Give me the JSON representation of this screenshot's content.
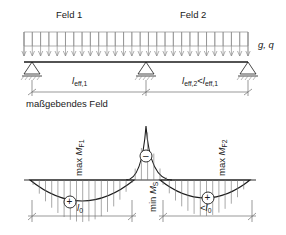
{
  "figure": {
    "title_fields": {
      "field1": "Feld 1",
      "field2": "Feld 2"
    },
    "load_label": "g, q",
    "span_labels": {
      "span1": "l",
      "span1_sub": "eff,1",
      "span2": "l",
      "span2_sub": "eff,2",
      "span2_rel": "<",
      "span2_ref": "l",
      "span2_ref_sub": "eff,1"
    },
    "note": "maßgebendes Feld",
    "moment_labels": {
      "max_field1_prefix": "max ",
      "max_field1_sym": "M",
      "max_field1_sub": "F1",
      "max_field2_prefix": "max ",
      "max_field2_sym": "M",
      "max_field2_sub": "F2",
      "min_support_prefix": "min ",
      "min_support_sym": "M",
      "min_support_sub": "S"
    },
    "sign_markers": {
      "positive": "+",
      "negative": "–"
    },
    "bottom_dim_labels": {
      "left": "l",
      "left_sub": "0",
      "right_rel": "<",
      "right": "l",
      "right_sub": "0"
    },
    "colors": {
      "line": "#1a1a1a",
      "hatch": "#8c8c8c",
      "dim": "#6e6e6e",
      "text": "#1a1a1a"
    }
  }
}
